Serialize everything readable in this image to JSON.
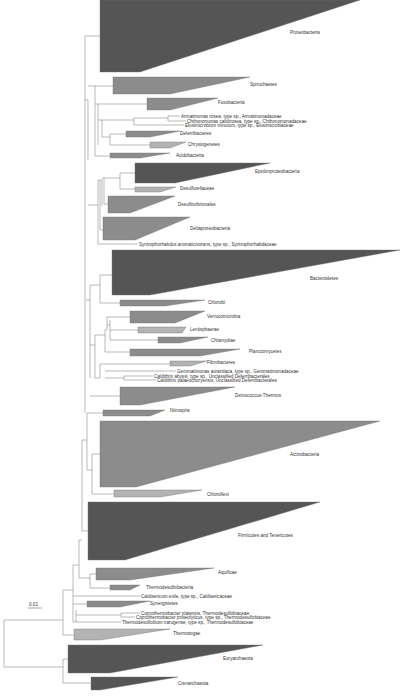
{
  "figure": {
    "type": "phylogenetic_tree",
    "scale_bar": {
      "label": "0.01",
      "x1": 28,
      "x2": 42,
      "y": 606
    }
  },
  "colors": {
    "dark": "#555555",
    "medium": "#8c8c8c",
    "light": "#b3b3b3",
    "branch": "#8a8a8a"
  },
  "clades": [
    {
      "name": "Proteobacteria",
      "x": 100,
      "y1": 0,
      "y2": 72,
      "tipx": 360,
      "tipy": 0,
      "basex2": 140,
      "color": "dark",
      "lx": 290,
      "ly": 34
    },
    {
      "name": "Spirochaetes",
      "x": 113,
      "y1": 77,
      "y2": 94,
      "tipx": 250,
      "tipy": 77,
      "basex2": 170,
      "color": "medium",
      "lx": 250,
      "ly": 86
    },
    {
      "name": "Fusobacteria",
      "x": 147,
      "y1": 98,
      "y2": 110,
      "tipx": 218,
      "tipy": 98,
      "basex2": 170,
      "color": "medium",
      "lx": 218,
      "ly": 104
    },
    {
      "name": "Deferribacteres",
      "x": 126,
      "y1": 131,
      "y2": 137,
      "tipx": 180,
      "tipy": 131,
      "basex2": 150,
      "color": "medium",
      "lx": 180,
      "ly": 135
    },
    {
      "name": "Chrysiogenetes",
      "x": 150,
      "y1": 142,
      "y2": 148,
      "tipx": 186,
      "tipy": 142,
      "basex2": 170,
      "color": "light",
      "lx": 188,
      "ly": 146
    },
    {
      "name": "Acidobacteria",
      "x": 110,
      "y1": 153,
      "y2": 158,
      "tipx": 170,
      "tipy": 153,
      "basex2": 140,
      "color": "medium",
      "lx": 176,
      "ly": 157
    },
    {
      "name": "Epsilonproteobacteria",
      "x": 135,
      "y1": 163,
      "y2": 183,
      "tipx": 270,
      "tipy": 163,
      "basex2": 175,
      "color": "dark",
      "lx": 255,
      "ly": 173
    },
    {
      "name": "Desulfurellaceae",
      "x": 135,
      "y1": 187,
      "y2": 192,
      "tipx": 176,
      "tipy": 187,
      "basex2": 160,
      "color": "light",
      "lx": 180,
      "ly": 190
    },
    {
      "name": "Desulfovibrionales",
      "x": 108,
      "y1": 196,
      "y2": 213,
      "tipx": 175,
      "tipy": 196,
      "basex2": 130,
      "color": "medium",
      "lx": 178,
      "ly": 206
    },
    {
      "name": "Deltaproteobacteria",
      "x": 103,
      "y1": 217,
      "y2": 240,
      "tipx": 190,
      "tipy": 217,
      "basex2": 135,
      "color": "medium",
      "lx": 190,
      "ly": 230
    },
    {
      "name": "Bacteroidetes",
      "x": 112,
      "y1": 250,
      "y2": 295,
      "tipx": 400,
      "tipy": 250,
      "basex2": 150,
      "color": "dark",
      "lx": 310,
      "ly": 280
    },
    {
      "name": "Chlorobi",
      "x": 120,
      "y1": 300,
      "y2": 306,
      "tipx": 205,
      "tipy": 300,
      "basex2": 165,
      "color": "medium",
      "lx": 208,
      "ly": 304
    },
    {
      "name": "Verrucomicrobia",
      "x": 130,
      "y1": 311,
      "y2": 323,
      "tipx": 205,
      "tipy": 311,
      "basex2": 175,
      "color": "medium",
      "lx": 207,
      "ly": 318
    },
    {
      "name": "Lentisphaerae",
      "x": 138,
      "y1": 327,
      "y2": 333,
      "tipx": 186,
      "tipy": 327,
      "basex2": 182,
      "color": "light",
      "lx": 190,
      "ly": 331
    },
    {
      "name": "Chlamydiae",
      "x": 158,
      "y1": 337,
      "y2": 343,
      "tipx": 208,
      "tipy": 337,
      "basex2": 180,
      "color": "medium",
      "lx": 211,
      "ly": 342
    },
    {
      "name": "Planctomycetes",
      "x": 130,
      "y1": 349,
      "y2": 356,
      "tipx": 240,
      "tipy": 349,
      "basex2": 200,
      "color": "medium",
      "lx": 249,
      "ly": 353
    },
    {
      "name": "Fibrobacteres",
      "x": 170,
      "y1": 361,
      "y2": 366,
      "tipx": 207,
      "tipy": 361,
      "basex2": 190,
      "color": "light",
      "lx": 207,
      "ly": 364
    },
    {
      "name": "Deinococcus-Thermus",
      "x": 120,
      "y1": 387,
      "y2": 405,
      "tipx": 235,
      "tipy": 387,
      "basex2": 140,
      "color": "medium",
      "lx": 235,
      "ly": 397
    },
    {
      "name": "Nitrospira",
      "x": 103,
      "y1": 410,
      "y2": 416,
      "tipx": 165,
      "tipy": 410,
      "basex2": 150,
      "color": "medium",
      "lx": 170,
      "ly": 412
    },
    {
      "name": "Actinobacteria",
      "x": 100,
      "y1": 421,
      "y2": 487,
      "tipx": 380,
      "tipy": 421,
      "basex2": 136,
      "color": "medium",
      "lx": 290,
      "ly": 456
    },
    {
      "name": "Chloroflexi",
      "x": 114,
      "y1": 490,
      "y2": 497,
      "tipx": 202,
      "tipy": 490,
      "basex2": 160,
      "color": "light",
      "lx": 207,
      "ly": 496
    },
    {
      "name": "Firmicutes and Tenericutes",
      "x": 88,
      "y1": 502,
      "y2": 560,
      "tipx": 320,
      "tipy": 502,
      "basex2": 125,
      "color": "dark",
      "lx": 238,
      "ly": 537
    },
    {
      "name": "Aquificae",
      "x": 96,
      "y1": 568,
      "y2": 580,
      "tipx": 214,
      "tipy": 568,
      "basex2": 130,
      "color": "medium",
      "lx": 218,
      "ly": 574
    },
    {
      "name": "Thermodesulfobacteria",
      "x": 110,
      "y1": 585,
      "y2": 590,
      "tipx": 140,
      "tipy": 585,
      "basex2": 130,
      "color": "medium",
      "lx": 146,
      "ly": 589
    },
    {
      "name": "Synergistetes",
      "x": 87,
      "y1": 601,
      "y2": 607,
      "tipx": 150,
      "tipy": 601,
      "basex2": 120,
      "color": "medium",
      "lx": 150,
      "ly": 605
    },
    {
      "name": "Thermotogae",
      "x": 74,
      "y1": 629,
      "y2": 640,
      "tipx": 170,
      "tipy": 629,
      "basex2": 100,
      "color": "light",
      "lx": 173,
      "ly": 635
    },
    {
      "name": "Euryarchaeota",
      "x": 68,
      "y1": 645,
      "y2": 673,
      "tipx": 263,
      "tipy": 645,
      "basex2": 110,
      "color": "dark",
      "lx": 223,
      "ly": 660
    },
    {
      "name": "Crenarchaeota",
      "x": 91,
      "y1": 677,
      "y2": 690,
      "tipx": 178,
      "tipy": 677,
      "basex2": 100,
      "color": "dark",
      "lx": 178,
      "ly": 685
    }
  ],
  "leaves": [
    {
      "name": "Armatimonas rosea, type sp., Armatimonadaceae",
      "x1": 170,
      "x2": 180,
      "y": 116,
      "lx": 181
    },
    {
      "name": "Chthonomonas calidirosea, type sp., Chthonomonadaceae",
      "x1": 172,
      "x2": 186,
      "y": 121,
      "lx": 187
    },
    {
      "name": "Elusimicrobium minutum, type sp., Elusimicrobiaceae",
      "x1": 134,
      "x2": 184,
      "y": 125,
      "lx": 185
    },
    {
      "name": "Syntrophorhabdus aromaticivorans, type sp., Syntrophorhabdaceae",
      "x1": 104,
      "x2": 138,
      "y": 244,
      "lx": 139
    },
    {
      "name": "Gemmatimonas aurantiaca, type sp., Gemmatimonadaceae",
      "x1": 124,
      "x2": 176,
      "y": 371,
      "lx": 177
    },
    {
      "name": "Caldithrix abyssi, type sp., Unclassified Deferribacterales",
      "x1": 146,
      "x2": 153,
      "y": 376,
      "lx": 154
    },
    {
      "name": "Caldithrix palaeochoryensis, Unclassified Deferribacterales",
      "x1": 146,
      "x2": 156,
      "y": 380,
      "lx": 157
    },
    {
      "name": "Caldisericum exile, type sp., Caldisericaceae",
      "x1": 74,
      "x2": 140,
      "y": 596,
      "lx": 141
    },
    {
      "name": "Coprothermobacter platensis, Thermodesulfobiaceae",
      "x1": 123,
      "x2": 140,
      "y": 613,
      "lx": 141
    },
    {
      "name": "Coprothermobacter proteolyticus, type sp., Thermodesulfobiaceae",
      "x1": 123,
      "x2": 135,
      "y": 617,
      "lx": 136
    },
    {
      "name": "Thermodesulfobium narugense, type sp., Thermodesulfobiaceae",
      "x1": 77,
      "x2": 121,
      "y": 622,
      "lx": 122
    }
  ],
  "branches": [
    [
      4,
      620,
      4,
      667
    ],
    [
      4,
      620,
      63,
      620
    ],
    [
      4,
      667,
      63,
      667
    ],
    [
      63,
      590,
      63,
      635
    ],
    [
      63,
      635,
      74,
      635
    ],
    [
      63,
      659,
      63,
      683
    ],
    [
      63,
      659,
      68,
      659
    ],
    [
      63,
      683,
      91,
      683
    ],
    [
      73,
      565,
      73,
      622
    ],
    [
      63,
      590,
      73,
      590
    ],
    [
      73,
      596,
      74,
      596
    ],
    [
      73,
      604,
      87,
      604
    ],
    [
      73,
      622,
      77,
      622
    ],
    [
      76,
      610,
      76,
      622
    ],
    [
      76,
      615,
      121,
      615
    ],
    [
      121,
      613,
      121,
      617
    ],
    [
      121,
      613,
      123,
      613
    ],
    [
      121,
      617,
      123,
      617
    ],
    [
      73,
      565,
      79,
      565
    ],
    [
      79,
      540,
      79,
      578
    ],
    [
      79,
      578,
      90,
      578
    ],
    [
      90,
      574,
      90,
      588
    ],
    [
      90,
      574,
      96,
      574
    ],
    [
      90,
      588,
      110,
      588
    ],
    [
      79,
      540,
      82,
      540
    ],
    [
      82,
      440,
      82,
      531
    ],
    [
      82,
      531,
      88,
      531
    ],
    [
      82,
      440,
      87,
      440
    ],
    [
      87,
      413,
      87,
      470
    ],
    [
      87,
      413,
      103,
      413
    ],
    [
      87,
      470,
      92,
      470
    ],
    [
      92,
      454,
      92,
      494
    ],
    [
      92,
      454,
      100,
      454
    ],
    [
      92,
      494,
      114,
      494
    ],
    [
      85,
      413,
      85,
      395
    ],
    [
      85,
      160,
      85,
      395
    ],
    [
      85,
      36,
      85,
      160
    ],
    [
      85,
      36,
      100,
      36
    ],
    [
      88,
      100,
      88,
      160
    ],
    [
      85,
      100,
      88,
      100
    ],
    [
      95,
      86,
      95,
      156
    ],
    [
      88,
      86,
      95,
      86
    ],
    [
      95,
      86,
      113,
      86
    ],
    [
      98,
      104,
      98,
      145
    ],
    [
      95,
      104,
      98,
      104
    ],
    [
      98,
      104,
      147,
      104
    ],
    [
      102,
      120,
      102,
      137
    ],
    [
      98,
      120,
      102,
      120
    ],
    [
      102,
      120,
      134,
      120
    ],
    [
      134,
      118,
      134,
      125
    ],
    [
      134,
      118,
      168,
      118
    ],
    [
      168,
      116,
      168,
      121
    ],
    [
      168,
      116,
      170,
      116
    ],
    [
      168,
      121,
      172,
      121
    ],
    [
      102,
      137,
      110,
      137
    ],
    [
      110,
      134,
      110,
      145
    ],
    [
      110,
      134,
      126,
      134
    ],
    [
      110,
      145,
      150,
      145
    ],
    [
      95,
      156,
      110,
      156
    ],
    [
      88,
      205,
      98,
      205
    ],
    [
      98,
      180,
      98,
      244
    ],
    [
      98,
      244,
      104,
      244
    ],
    [
      100,
      180,
      100,
      230
    ],
    [
      98,
      180,
      100,
      180
    ],
    [
      102,
      180,
      102,
      206
    ],
    [
      100,
      180,
      102,
      180
    ],
    [
      104,
      178,
      104,
      204
    ],
    [
      102,
      178,
      104,
      178
    ],
    [
      104,
      178,
      120,
      178
    ],
    [
      120,
      173,
      120,
      189
    ],
    [
      120,
      173,
      135,
      173
    ],
    [
      120,
      189,
      135,
      189
    ],
    [
      104,
      204,
      108,
      204
    ],
    [
      100,
      230,
      103,
      230
    ],
    [
      86,
      300,
      90,
      300
    ],
    [
      90,
      285,
      90,
      378
    ],
    [
      90,
      285,
      100,
      285
    ],
    [
      100,
      275,
      100,
      303
    ],
    [
      100,
      275,
      112,
      275
    ],
    [
      100,
      303,
      120,
      303
    ],
    [
      90,
      345,
      95,
      345
    ],
    [
      95,
      335,
      95,
      378
    ],
    [
      95,
      335,
      105,
      335
    ],
    [
      105,
      330,
      105,
      352
    ],
    [
      105,
      352,
      130,
      352
    ],
    [
      107,
      317,
      107,
      330
    ],
    [
      105,
      330,
      107,
      330
    ],
    [
      107,
      317,
      130,
      317
    ],
    [
      110,
      320,
      110,
      340
    ],
    [
      107,
      325,
      110,
      325
    ],
    [
      110,
      330,
      138,
      330
    ],
    [
      110,
      340,
      158,
      340
    ],
    [
      95,
      378,
      100,
      378
    ],
    [
      100,
      364,
      100,
      378
    ],
    [
      100,
      364,
      170,
      364
    ],
    [
      105,
      371,
      124,
      371
    ],
    [
      124,
      376,
      124,
      380
    ],
    [
      105,
      378,
      124,
      378
    ],
    [
      124,
      376,
      146,
      376
    ],
    [
      124,
      380,
      146,
      380
    ],
    [
      90,
      396,
      120,
      396
    ]
  ]
}
